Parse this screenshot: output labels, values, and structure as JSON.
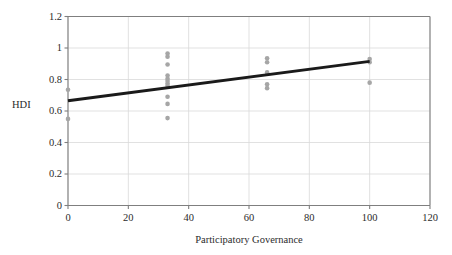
{
  "chart_data": {
    "type": "scatter",
    "title": "",
    "subtitle": "",
    "xlabel": "Participatory Governance",
    "ylabel": "HDI",
    "xlim": [
      0,
      120
    ],
    "ylim": [
      0,
      1.2
    ],
    "xticks": [
      0,
      20,
      40,
      60,
      80,
      100,
      120
    ],
    "xtick_labels": [
      "0",
      "20",
      "40",
      "60",
      "80",
      "100",
      "120"
    ],
    "yticks": [
      0,
      0.2,
      0.4,
      0.6,
      0.8,
      1,
      1.2
    ],
    "ytick_labels": [
      "0",
      "0.2",
      "0.4",
      "0.6",
      "0.8",
      "1",
      "1.2"
    ],
    "grid": true,
    "grid_axis": "both",
    "grid_color": "#d9d9d9",
    "axis_color": "#7f7f7f",
    "legend": false,
    "legend_position": "none",
    "marker_color": "#a6a6a6",
    "marker_size": 4.6,
    "marker_shape": "circle",
    "series": [
      {
        "name": "Countries",
        "points": [
          {
            "x": 0,
            "y": 0.735
          },
          {
            "x": 0,
            "y": 0.55
          },
          {
            "x": 33,
            "y": 0.965
          },
          {
            "x": 33,
            "y": 0.945
          },
          {
            "x": 33,
            "y": 0.895
          },
          {
            "x": 33,
            "y": 0.825
          },
          {
            "x": 33,
            "y": 0.805
          },
          {
            "x": 33,
            "y": 0.79
          },
          {
            "x": 33,
            "y": 0.775
          },
          {
            "x": 33,
            "y": 0.76
          },
          {
            "x": 33,
            "y": 0.69
          },
          {
            "x": 33,
            "y": 0.645
          },
          {
            "x": 33,
            "y": 0.555
          },
          {
            "x": 66,
            "y": 0.935
          },
          {
            "x": 66,
            "y": 0.91
          },
          {
            "x": 66,
            "y": 0.845
          },
          {
            "x": 66,
            "y": 0.77
          },
          {
            "x": 66,
            "y": 0.745
          },
          {
            "x": 100,
            "y": 0.93
          },
          {
            "x": 100,
            "y": 0.91
          },
          {
            "x": 100,
            "y": 0.78
          }
        ]
      }
    ],
    "trendline": {
      "name": "Linear fit",
      "color": "#1a1a1a",
      "width": 3.0,
      "x_start": 0,
      "y_start": 0.665,
      "x_end": 100,
      "y_end": 0.915
    }
  }
}
